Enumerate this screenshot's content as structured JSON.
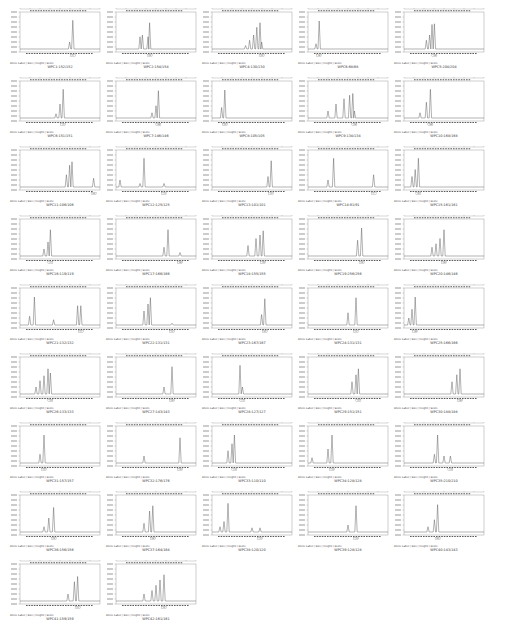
{
  "legend": "Allele Label  |  Size  |  Height  |  Score",
  "colors": {
    "trace": "#555555",
    "axis": "#777777",
    "bin": "#333333",
    "frame": "#888888"
  },
  "chart_data": [
    {
      "type": "line",
      "title": "WPC1:152/152",
      "peaks": [
        [
          0.62,
          0.2
        ],
        [
          0.66,
          0.82
        ]
      ],
      "allele": "152"
    },
    {
      "type": "line",
      "title": "WPC2:154/154",
      "peaks": [
        [
          0.3,
          0.35
        ],
        [
          0.33,
          0.4
        ],
        [
          0.4,
          0.35
        ],
        [
          0.42,
          0.75
        ]
      ],
      "allele": "154"
    },
    {
      "type": "line",
      "title": "WPC4:130/130",
      "peaks": [
        [
          0.42,
          0.1
        ],
        [
          0.47,
          0.25
        ],
        [
          0.52,
          0.4
        ],
        [
          0.56,
          0.62
        ],
        [
          0.6,
          0.75
        ],
        [
          0.62,
          0.2
        ]
      ],
      "allele": "130"
    },
    {
      "type": "line",
      "title": "WPC6:68/68",
      "peaks": [
        [
          0.1,
          0.15
        ],
        [
          0.14,
          0.8
        ]
      ],
      "allele": "68"
    },
    {
      "type": "line",
      "title": "WPC5:204/204",
      "peaks": [
        [
          0.28,
          0.25
        ],
        [
          0.32,
          0.4
        ],
        [
          0.35,
          0.7
        ],
        [
          0.38,
          0.72
        ]
      ],
      "allele": "204"
    },
    {
      "type": "line",
      "title": "WPC6:151/151",
      "peaks": [
        [
          0.45,
          0.12
        ],
        [
          0.5,
          0.4
        ],
        [
          0.54,
          0.82
        ]
      ],
      "allele": "151"
    },
    {
      "type": "line",
      "title": "WPC7:146/146",
      "peaks": [
        [
          0.45,
          0.15
        ],
        [
          0.5,
          0.35
        ],
        [
          0.53,
          0.78
        ]
      ],
      "allele": "146"
    },
    {
      "type": "line",
      "title": "WPC8:105/105",
      "peaks": [
        [
          0.12,
          0.3
        ],
        [
          0.16,
          0.8
        ]
      ],
      "allele": "105"
    },
    {
      "type": "line",
      "title": "WPC9:134/134",
      "peaks": [
        [
          0.25,
          0.2
        ],
        [
          0.35,
          0.4
        ],
        [
          0.45,
          0.55
        ],
        [
          0.52,
          0.65
        ],
        [
          0.56,
          0.7
        ],
        [
          0.58,
          0.2
        ]
      ],
      "allele": "134"
    },
    {
      "type": "line",
      "title": "WPC10:168/168",
      "peaks": [
        [
          0.2,
          0.15
        ],
        [
          0.28,
          0.45
        ],
        [
          0.33,
          0.82
        ]
      ],
      "allele": "168"
    },
    {
      "type": "line",
      "title": "WPC11:106/106",
      "peaks": [
        [
          0.58,
          0.35
        ],
        [
          0.62,
          0.62
        ],
        [
          0.65,
          0.72
        ],
        [
          0.92,
          0.25
        ]
      ],
      "allele": "106"
    },
    {
      "type": "line",
      "title": "WPC12:125/125",
      "peaks": [
        [
          0.05,
          0.2
        ],
        [
          0.3,
          0.1
        ],
        [
          0.35,
          0.82
        ],
        [
          0.6,
          0.1
        ]
      ],
      "allele": "125"
    },
    {
      "type": "line",
      "title": "WPC13:101/101",
      "peaks": [
        [
          0.7,
          0.3
        ],
        [
          0.74,
          0.75
        ]
      ],
      "allele": "101"
    },
    {
      "type": "line",
      "title": "WPC14:91/91",
      "peaks": [
        [
          0.25,
          0.2
        ],
        [
          0.32,
          0.82
        ],
        [
          0.82,
          0.35
        ]
      ],
      "allele": "91"
    },
    {
      "type": "line",
      "title": "WPC15:161/161",
      "peaks": [
        [
          0.1,
          0.3
        ],
        [
          0.14,
          0.5
        ],
        [
          0.18,
          0.82
        ]
      ],
      "allele": "161"
    },
    {
      "type": "line",
      "title": "WPC16:119/119",
      "peaks": [
        [
          0.3,
          0.2
        ],
        [
          0.35,
          0.4
        ],
        [
          0.38,
          0.75
        ]
      ],
      "allele": "119"
    },
    {
      "type": "line",
      "title": "WPC17:166/166",
      "peaks": [
        [
          0.6,
          0.25
        ],
        [
          0.65,
          0.75
        ],
        [
          0.8,
          0.1
        ]
      ],
      "allele": "166"
    },
    {
      "type": "line",
      "title": "WPC18:155/155",
      "peaks": [
        [
          0.45,
          0.3
        ],
        [
          0.55,
          0.5
        ],
        [
          0.6,
          0.6
        ],
        [
          0.64,
          0.72
        ]
      ],
      "allele": "155"
    },
    {
      "type": "line",
      "title": "WPC19:256/256",
      "peaks": [
        [
          0.62,
          0.45
        ],
        [
          0.67,
          0.8
        ]
      ],
      "allele": "256"
    },
    {
      "type": "line",
      "title": "WPC20:146/146",
      "peaks": [
        [
          0.35,
          0.25
        ],
        [
          0.4,
          0.35
        ],
        [
          0.45,
          0.5
        ],
        [
          0.5,
          0.75
        ]
      ],
      "allele": "146"
    },
    {
      "type": "line",
      "title": "WPC21:132/132",
      "peaks": [
        [
          0.12,
          0.25
        ],
        [
          0.18,
          0.8
        ],
        [
          0.42,
          0.15
        ],
        [
          0.72,
          0.55
        ],
        [
          0.76,
          0.55
        ]
      ],
      "allele": "132"
    },
    {
      "type": "line",
      "title": "WPC22:131/131",
      "peaks": [
        [
          0.35,
          0.4
        ],
        [
          0.4,
          0.6
        ],
        [
          0.43,
          0.78
        ],
        [
          0.7,
          0.05
        ]
      ],
      "allele": "131"
    },
    {
      "type": "line",
      "title": "WPC23:167/167",
      "peaks": [
        [
          0.62,
          0.3
        ],
        [
          0.66,
          0.75
        ]
      ],
      "allele": "167"
    },
    {
      "type": "line",
      "title": "WPC24:131/131",
      "peaks": [
        [
          0.5,
          0.35
        ],
        [
          0.6,
          0.78
        ]
      ],
      "allele": "131"
    },
    {
      "type": "line",
      "title": "WPC25:166/166",
      "peaks": [
        [
          0.06,
          0.2
        ],
        [
          0.1,
          0.45
        ],
        [
          0.14,
          0.8
        ]
      ],
      "allele": "166"
    },
    {
      "type": "line",
      "title": "WPC26:133/133",
      "peaks": [
        [
          0.2,
          0.2
        ],
        [
          0.25,
          0.38
        ],
        [
          0.3,
          0.52
        ],
        [
          0.35,
          0.72
        ],
        [
          0.38,
          0.6
        ]
      ],
      "allele": "133"
    },
    {
      "type": "line",
      "title": "WPC27:143/143",
      "peaks": [
        [
          0.6,
          0.2
        ],
        [
          0.7,
          0.78
        ]
      ],
      "allele": "143"
    },
    {
      "type": "line",
      "title": "WPC28:127/127",
      "peaks": [
        [
          0.35,
          0.82
        ],
        [
          0.38,
          0.2
        ]
      ],
      "allele": "127"
    },
    {
      "type": "line",
      "title": "WPC29:151/151",
      "peaks": [
        [
          0.55,
          0.35
        ],
        [
          0.6,
          0.55
        ],
        [
          0.63,
          0.72
        ]
      ],
      "allele": "151"
    },
    {
      "type": "line",
      "title": "WPC30:188/188",
      "peaks": [
        [
          0.6,
          0.35
        ],
        [
          0.66,
          0.55
        ],
        [
          0.7,
          0.72
        ]
      ],
      "allele": "188"
    },
    {
      "type": "line",
      "title": "WPC31:157/157",
      "peaks": [
        [
          0.25,
          0.25
        ],
        [
          0.3,
          0.8
        ]
      ],
      "allele": "157"
    },
    {
      "type": "line",
      "title": "WPC32:176/176",
      "peaks": [
        [
          0.35,
          0.2
        ],
        [
          0.8,
          0.72
        ]
      ],
      "allele": "176"
    },
    {
      "type": "line",
      "title": "WPC33:110/110",
      "peaks": [
        [
          0.2,
          0.35
        ],
        [
          0.25,
          0.55
        ],
        [
          0.28,
          0.8
        ]
      ],
      "allele": "110"
    },
    {
      "type": "line",
      "title": "WPC34:128/128",
      "peaks": [
        [
          0.05,
          0.15
        ],
        [
          0.25,
          0.4
        ],
        [
          0.3,
          0.8
        ]
      ],
      "allele": "128"
    },
    {
      "type": "line",
      "title": "WPC35:210/210",
      "peaks": [
        [
          0.38,
          0.25
        ],
        [
          0.42,
          0.8
        ],
        [
          0.5,
          0.2
        ],
        [
          0.58,
          0.2
        ]
      ],
      "allele": "210"
    },
    {
      "type": "line",
      "title": "WPC36:156/156",
      "peaks": [
        [
          0.3,
          0.15
        ],
        [
          0.36,
          0.4
        ],
        [
          0.42,
          0.7
        ]
      ],
      "allele": "156"
    },
    {
      "type": "line",
      "title": "WPC37:164/164",
      "peaks": [
        [
          0.35,
          0.25
        ],
        [
          0.42,
          0.6
        ],
        [
          0.46,
          0.75
        ]
      ],
      "allele": "164"
    },
    {
      "type": "line",
      "title": "WPC38:120/120",
      "peaks": [
        [
          0.1,
          0.15
        ],
        [
          0.15,
          0.3
        ],
        [
          0.2,
          0.82
        ],
        [
          0.5,
          0.12
        ],
        [
          0.6,
          0.12
        ]
      ],
      "allele": "120"
    },
    {
      "type": "line",
      "title": "WPC39:128/128",
      "peaks": [
        [
          0.5,
          0.2
        ],
        [
          0.6,
          0.75
        ]
      ],
      "allele": "128"
    },
    {
      "type": "line",
      "title": "WPC40:143/143",
      "peaks": [
        [
          0.3,
          0.15
        ],
        [
          0.38,
          0.35
        ],
        [
          0.42,
          0.78
        ]
      ],
      "allele": "143"
    },
    {
      "type": "line",
      "title": "WPC41:159/159",
      "peaks": [
        [
          0.6,
          0.2
        ],
        [
          0.68,
          0.55
        ],
        [
          0.72,
          0.7
        ]
      ],
      "allele": "159"
    },
    {
      "type": "line",
      "title": "WPC42:161/161",
      "peaks": [
        [
          0.35,
          0.2
        ],
        [
          0.45,
          0.3
        ],
        [
          0.5,
          0.45
        ],
        [
          0.55,
          0.6
        ],
        [
          0.6,
          0.75
        ]
      ],
      "allele": "161"
    }
  ]
}
